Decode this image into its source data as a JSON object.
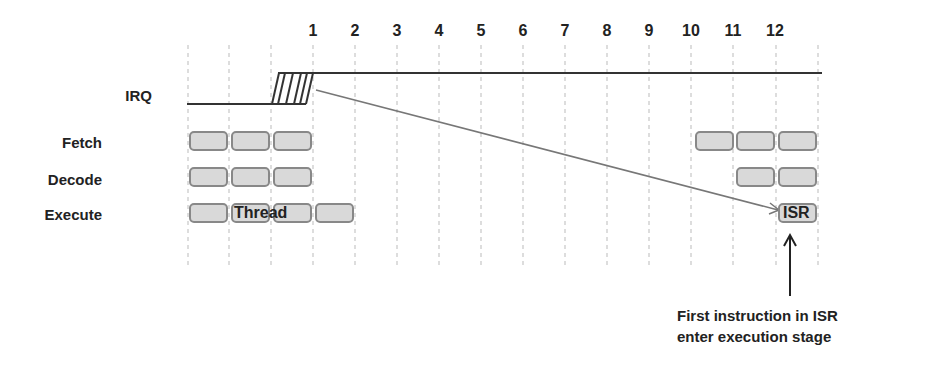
{
  "diagram": {
    "cycle_numbers": [
      "1",
      "2",
      "3",
      "4",
      "5",
      "6",
      "7",
      "8",
      "9",
      "10",
      "11",
      "12"
    ],
    "rows": {
      "irq": "IRQ",
      "fetch": "Fetch",
      "decode": "Decode",
      "execute": "Execute"
    },
    "box_labels": {
      "thread": "Thread",
      "isr": "ISR"
    },
    "annotation": {
      "line1": "First instruction in ISR",
      "line2": "enter execution stage"
    },
    "colors": {
      "box_fill": "#d9d9d9",
      "box_border": "#888888",
      "irq_line": "#333333",
      "arrow": "#777777",
      "grid": "#bbbbbb"
    }
  }
}
